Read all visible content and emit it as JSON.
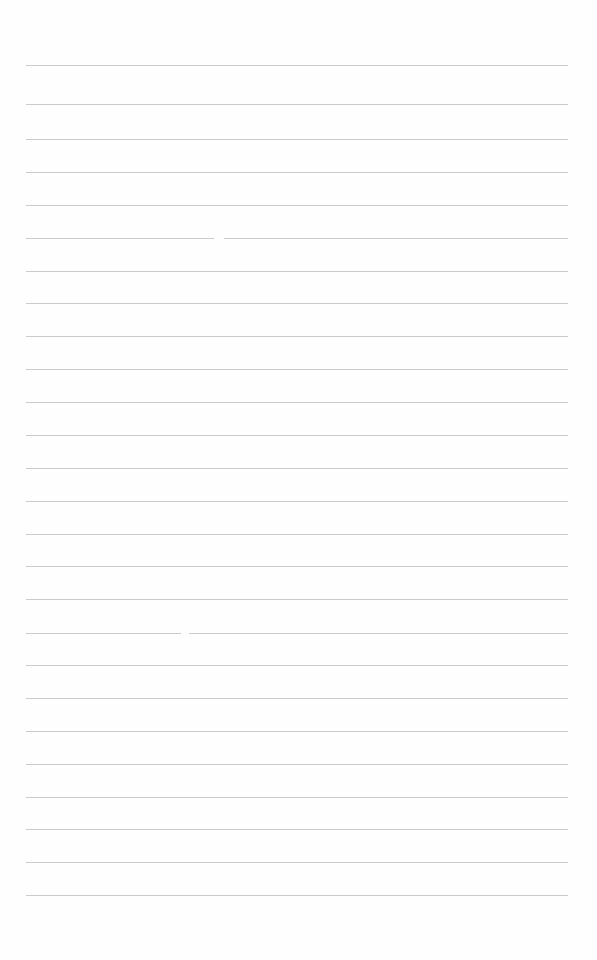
{
  "page": {
    "type": "lined-paper",
    "background_color": "#fefefe",
    "line_color": "#cbcbcb",
    "line_left": 26,
    "line_right": 568,
    "lines_y": [
      65,
      104,
      139,
      172,
      205,
      238,
      271,
      303,
      336,
      369,
      402,
      435,
      468,
      501,
      534,
      566,
      599,
      633,
      665,
      698,
      731,
      764,
      797,
      829,
      862,
      895
    ],
    "gaps": [
      {
        "line_index": 5,
        "x": 214,
        "width": 10
      },
      {
        "line_index": 17,
        "x": 181,
        "width": 8
      }
    ]
  }
}
